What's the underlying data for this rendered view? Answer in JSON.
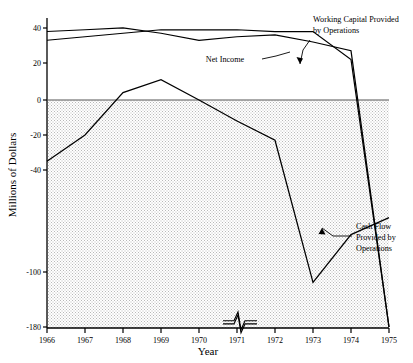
{
  "chart_data": {
    "type": "line",
    "title": "",
    "xlabel": "Year",
    "ylabel": "Millions of Dollars",
    "x": [
      1966,
      1967,
      1968,
      1969,
      1970,
      1971,
      1972,
      1973,
      1974,
      1975
    ],
    "xticklabels": [
      "1966",
      "1967",
      "1968",
      "1969",
      "1970",
      "1971",
      "1972",
      "1973",
      "1974",
      "1975"
    ],
    "yticklabels": [
      "40",
      "20",
      "0",
      "-20",
      "-40",
      "-100",
      "-180"
    ],
    "ytickvalues": [
      40,
      20,
      0,
      -20,
      -40,
      -100,
      -180
    ],
    "ylim": [
      -180,
      50
    ],
    "xlim": [
      1966,
      1975
    ],
    "grid": false,
    "legend": "annotations",
    "axis_break": "y-axis broken between -40 and -100; break squiggle drawn on the two low lines near 1971",
    "shaded_region": "area below zero is stippled gray",
    "series": [
      {
        "name": "Working Capital Provided by Operations",
        "values": [
          38,
          39,
          40,
          43,
          47,
          45,
          44,
          48,
          27,
          -180
        ]
      },
      {
        "name": "Net Income",
        "values": [
          33,
          35,
          37,
          39,
          41,
          39,
          38,
          42,
          22,
          -180
        ]
      },
      {
        "name": "Cash Flow Provided by Operations",
        "values": [
          -35,
          -20,
          4,
          11,
          0,
          -12,
          -23,
          -115,
          -78,
          -68
        ]
      }
    ],
    "annotations": [
      {
        "name": "working-capital-label",
        "text_line1": "Working Capital Provided",
        "text_line2": "by Operations"
      },
      {
        "name": "net-income-label",
        "text_line1": "Net Income",
        "text_line2": ""
      },
      {
        "name": "cash-flow-label",
        "text_line1": "Cash Flow",
        "text_line2": "Provided by",
        "text_line3": "Operations"
      }
    ]
  },
  "axes": {
    "y_title": "Millions of Dollars",
    "x_title": "Year",
    "yticks": [
      "40",
      "20",
      "0",
      "-20",
      "-40",
      "-100",
      "-180"
    ],
    "xticks": [
      "1966",
      "1967",
      "1968",
      "1969",
      "1970",
      "1971",
      "1972",
      "1973",
      "1974",
      "1975"
    ]
  },
  "labels": {
    "working_capital_l1": "Working Capital Provided",
    "working_capital_l2": "by Operations",
    "net_income": "Net Income",
    "cash_flow_l1": "Cash Flow",
    "cash_flow_l2": "Provided by",
    "cash_flow_l3": "Operations"
  },
  "colors": {
    "line": "#000000",
    "shade": "#d9d9d9",
    "background": "#ffffff"
  }
}
